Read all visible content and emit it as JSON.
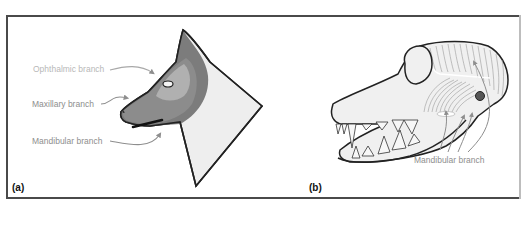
{
  "figure": {
    "panels": [
      {
        "id": "a",
        "label": "(a)",
        "subject": "dog head silhouette",
        "annotations": [
          {
            "text": "Ophthalmic branch",
            "color": "#b8b8b8"
          },
          {
            "text": "Maxillary branch",
            "color": "#8e8e8e"
          },
          {
            "text": "Mandibular branch",
            "color": "#8e8e8e"
          }
        ]
      },
      {
        "id": "b",
        "label": "(b)",
        "subject": "dog skull with jaw muscles",
        "annotations": [
          {
            "text": "Mandibular branch",
            "color": "#8e8e8e"
          }
        ]
      }
    ],
    "colors": {
      "border": "#4a4a4a",
      "head_fill": "#eeeeee",
      "ophthalmic_zone": "#b2b2b2",
      "maxillary_zone": "#8a8a8a",
      "mandibular_zone": "#7c7c7c",
      "arrow": "#8e8e8e",
      "outline": "#222222"
    }
  }
}
